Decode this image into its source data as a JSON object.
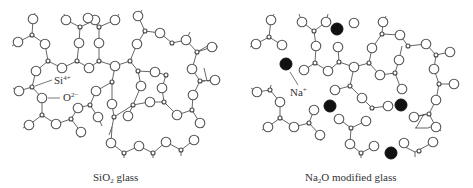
{
  "figure": {
    "panels": [
      {
        "id": "sio2",
        "caption_main": "SiO",
        "caption_sub": "2",
        "caption_rest": " glass",
        "labels": {
          "si": {
            "base": "Si",
            "sup": "4+"
          },
          "o": {
            "base": "O",
            "sup": "2−"
          }
        }
      },
      {
        "id": "na2o",
        "caption_main": "Na",
        "caption_sub": "2",
        "caption_rest": "O modified glass",
        "labels": {
          "na": {
            "base": "Na",
            "sup": "+"
          }
        }
      }
    ],
    "legend": {
      "small_open_circle": "Si4+",
      "large_open_circle": "O2−",
      "filled_circle": "Na+"
    },
    "colors": {
      "line": "#555555",
      "sodium": "#111111",
      "background": "#ffffff"
    }
  }
}
